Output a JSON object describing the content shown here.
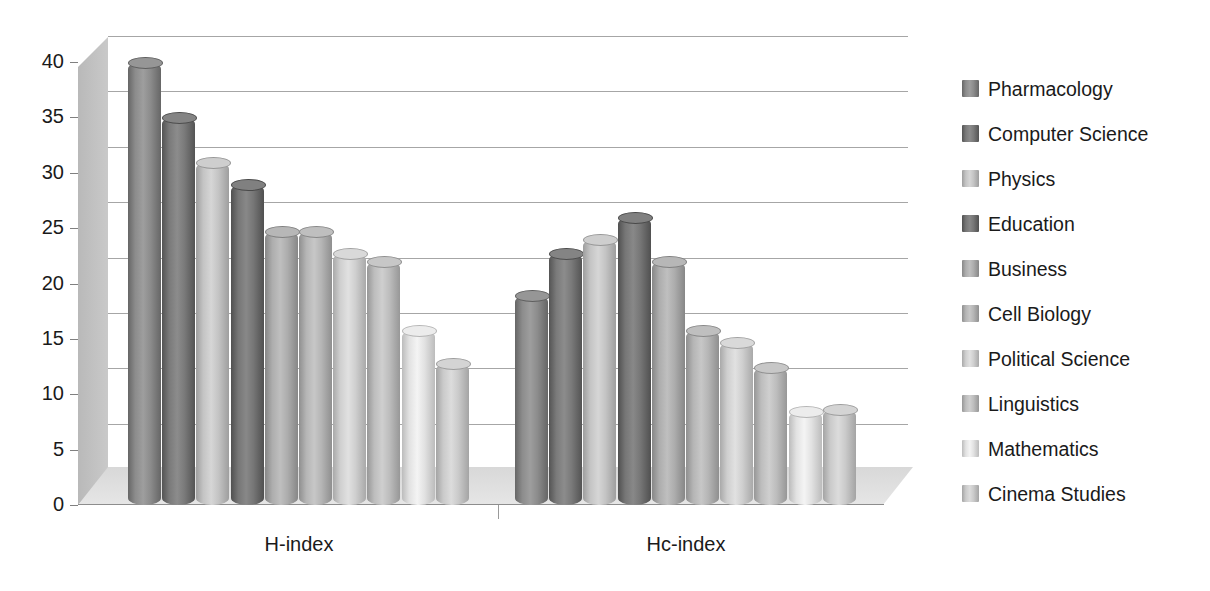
{
  "chart_data": {
    "type": "bar",
    "title": "",
    "subtitle": "",
    "xlabel": "",
    "ylabel": "",
    "categories": [
      "H-index",
      "Hc-index"
    ],
    "ylim": [
      0,
      40
    ],
    "ytick_step": 5,
    "ytick_labels": [
      "40",
      "35",
      "30",
      "25",
      "20",
      "15",
      "10",
      "5",
      "0"
    ],
    "ytick_values": [
      40,
      35,
      30,
      25,
      20,
      15,
      10,
      5,
      0
    ],
    "grid": true,
    "legend_position": "right",
    "style": "3d-cylinder-grayscale",
    "series": [
      {
        "name": "Pharmacology",
        "color": "#8c8c8c",
        "values": [
          40.0,
          19.0
        ]
      },
      {
        "name": "Computer Science",
        "color": "#7a7a7a",
        "values": [
          35.0,
          22.8
        ]
      },
      {
        "name": "Physics",
        "color": "#c4c4c4",
        "values": [
          31.0,
          24.0
        ]
      },
      {
        "name": "Education",
        "color": "#767676",
        "values": [
          29.0,
          26.0
        ]
      },
      {
        "name": "Business",
        "color": "#adadad",
        "values": [
          24.7,
          22.0
        ]
      },
      {
        "name": "Cell Biology",
        "color": "#b5b5b5",
        "values": [
          24.7,
          15.8
        ]
      },
      {
        "name": "Political Science",
        "color": "#cfcfcf",
        "values": [
          22.8,
          14.7
        ]
      },
      {
        "name": "Linguistics",
        "color": "#bdbdbd",
        "values": [
          22.0,
          12.5
        ]
      },
      {
        "name": "Mathematics",
        "color": "#e2e2e2",
        "values": [
          15.8,
          8.5
        ]
      },
      {
        "name": "Cinema Studies",
        "color": "#cacaca",
        "values": [
          12.8,
          8.7
        ]
      }
    ]
  },
  "legend": {
    "items": [
      {
        "label": "Pharmacology"
      },
      {
        "label": "Computer Science"
      },
      {
        "label": "Physics"
      },
      {
        "label": "Education"
      },
      {
        "label": "Business"
      },
      {
        "label": "Cell Biology"
      },
      {
        "label": "Political Science"
      },
      {
        "label": "Linguistics"
      },
      {
        "label": "Mathematics"
      },
      {
        "label": "Cinema Studies"
      }
    ]
  },
  "axes": {
    "y_labels": [
      "40",
      "35",
      "30",
      "25",
      "20",
      "15",
      "10",
      "5",
      "0"
    ],
    "x_labels": [
      "H-index",
      "Hc-index"
    ]
  }
}
